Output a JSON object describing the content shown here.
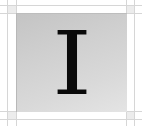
{
  "tile": {
    "letter": "I",
    "letter_color": "#0a0a0a",
    "background_gradient": [
      "#c4c4c4",
      "#e4e4e4"
    ]
  },
  "frame": {
    "line_color": "#d6d6d6",
    "corner_color": "#ececec"
  }
}
